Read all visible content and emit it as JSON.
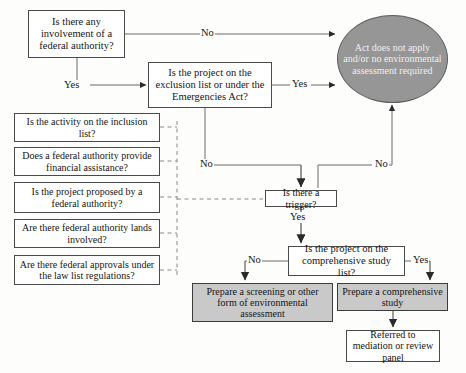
{
  "diagram": {
    "colors": {
      "terminal_fill": "#969696",
      "shaded_fill": "#c9c9c9",
      "node_fill": "#ffffff",
      "stroke": "#4a4a4a",
      "text": "#151515",
      "terminal_text": "#efefef",
      "background": "#fdfdfc"
    },
    "nodes": [
      {
        "id": "federal-involvement",
        "name": "decision-federal-involvement",
        "text": "Is there any involvement of a federal authority?",
        "shape": "rect",
        "fill": "white",
        "x": 28,
        "y": 10,
        "w": 97,
        "h": 48,
        "font_size": 10.5
      },
      {
        "id": "exclusion-list",
        "name": "decision-exclusion-list",
        "text": "Is the project on the exclusion list or under the Emergencies Act?",
        "shape": "rect",
        "fill": "white",
        "x": 148,
        "y": 62,
        "w": 124,
        "h": 46,
        "font_size": 10.5
      },
      {
        "id": "act-does-not-apply",
        "name": "terminal-act-does-not-apply",
        "text": "Act does not apply and/or no environmental assessment required",
        "shape": "ellipse",
        "fill": "gray",
        "x": 337,
        "y": 15,
        "w": 111,
        "h": 88,
        "font_size": 10
      },
      {
        "id": "inclusion-list",
        "name": "trigger-inclusion-list",
        "text": "Is the activity on the inclusion list?",
        "shape": "rect",
        "fill": "white",
        "x": 14,
        "y": 113,
        "w": 146,
        "h": 29,
        "font_size": 10
      },
      {
        "id": "financial-assistance",
        "name": "trigger-financial-assistance",
        "text": "Does a federal authority provide financial assistance?",
        "shape": "rect",
        "fill": "white",
        "x": 14,
        "y": 147,
        "w": 146,
        "h": 29,
        "font_size": 10
      },
      {
        "id": "proposed-by-federal",
        "name": "trigger-proposed-by-federal-authority",
        "text": "Is the project proposed by a federal authority?",
        "shape": "rect",
        "fill": "white",
        "x": 14,
        "y": 182,
        "w": 146,
        "h": 31,
        "font_size": 10
      },
      {
        "id": "federal-lands",
        "name": "trigger-federal-authority-lands",
        "text": "Are there federal authority lands involved?",
        "shape": "rect",
        "fill": "white",
        "x": 14,
        "y": 219,
        "w": 146,
        "h": 29,
        "font_size": 10
      },
      {
        "id": "law-list-approvals",
        "name": "trigger-law-list-approvals",
        "text": "Are there federal approvals under the law list regulations?",
        "shape": "rect",
        "fill": "white",
        "x": 14,
        "y": 255,
        "w": 146,
        "h": 30,
        "font_size": 10
      },
      {
        "id": "is-there-trigger",
        "name": "decision-is-there-a-trigger",
        "text": "Is there a trigger?",
        "shape": "rect",
        "fill": "white",
        "x": 265,
        "y": 190,
        "w": 72,
        "h": 17,
        "font_size": 10
      },
      {
        "id": "comprehensive-study-list",
        "name": "decision-comprehensive-study-list",
        "text": "Is the project on the comprehensive study list?",
        "shape": "rect",
        "fill": "white",
        "x": 288,
        "y": 246,
        "w": 117,
        "h": 30,
        "font_size": 10.5
      },
      {
        "id": "prepare-screening",
        "name": "outcome-prepare-screening",
        "text": "Prepare a screening or other form of environmental assessment",
        "shape": "rect",
        "fill": "shaded",
        "x": 192,
        "y": 283,
        "w": 141,
        "h": 39,
        "font_size": 10
      },
      {
        "id": "prepare-comprehensive-study",
        "name": "outcome-prepare-comprehensive-study",
        "text": "Prepare a comprehensive study",
        "shape": "rect",
        "fill": "shaded",
        "x": 337,
        "y": 283,
        "w": 111,
        "h": 28,
        "font_size": 10
      },
      {
        "id": "referred-to-mediation",
        "name": "outcome-referred-to-mediation",
        "text": "Referred to mediation or review panel",
        "shape": "rect",
        "fill": "white",
        "x": 346,
        "y": 330,
        "w": 94,
        "h": 32,
        "font_size": 10
      }
    ],
    "edge_labels": [
      {
        "id": "no-federal-involvement",
        "name": "edge-label-no-federal-involvement",
        "text": "No",
        "x": 200,
        "y": 28,
        "font_size": 10.5
      },
      {
        "id": "yes-federal-involvement",
        "name": "edge-label-yes-federal-involvement",
        "text": "Yes",
        "x": 63,
        "y": 80,
        "font_size": 10.5
      },
      {
        "id": "yes-exclusion-list",
        "name": "edge-label-yes-exclusion-list",
        "text": "Yes",
        "x": 295,
        "y": 80,
        "font_size": 10.5
      },
      {
        "id": "no-exclusion-list",
        "name": "edge-label-no-exclusion-list",
        "text": "No",
        "x": 199,
        "y": 159,
        "font_size": 10.5
      },
      {
        "id": "no-trigger",
        "name": "edge-label-no-trigger",
        "text": "No",
        "x": 376,
        "y": 159,
        "font_size": 10.5
      },
      {
        "id": "yes-trigger",
        "name": "edge-label-yes-trigger",
        "text": "Yes",
        "x": 291,
        "y": 212,
        "font_size": 10.5
      },
      {
        "id": "no-comprehensive",
        "name": "edge-label-no-comprehensive-study",
        "text": "No",
        "x": 248,
        "y": 255,
        "font_size": 10.5
      },
      {
        "id": "yes-comprehensive",
        "name": "edge-label-yes-comprehensive-study",
        "text": "Yes",
        "x": 414,
        "y": 255,
        "font_size": 10.5
      }
    ]
  }
}
